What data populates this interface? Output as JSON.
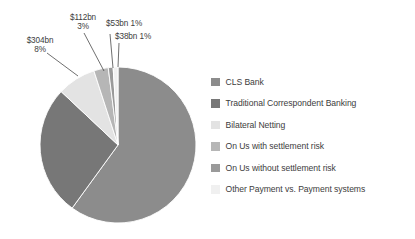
{
  "chart_data": {
    "type": "pie",
    "title": "",
    "subtitle": "",
    "xlabel": "",
    "ylabel": "",
    "grid": false,
    "legend_position": "right",
    "units": "USD billions (daily average)",
    "start_angle_deg": 0,
    "direction": "clockwise",
    "categories": [
      "CLS Bank",
      "Traditional Correspondent Banking",
      "Bilateral Netting",
      "On Us with settlement risk",
      "On Us without settlement risk",
      "Other Payment vs. Payment systems"
    ],
    "values": [
      2275,
      1025,
      304,
      112,
      53,
      38
    ],
    "percents": [
      60,
      27,
      8,
      3,
      1,
      1
    ],
    "colors": [
      "#8c8c8c",
      "#777777",
      "#e3e3e3",
      "#b6b6b6",
      "#9a9a9a",
      "#f0f0f0"
    ],
    "slices": [
      {
        "label": "CLS Bank",
        "value": 2275,
        "percent": 60,
        "color": "#8c8c8c",
        "start_deg": 0,
        "end_deg": 216,
        "data_label": ""
      },
      {
        "label": "Traditional Correspondent Banking",
        "value": 1025,
        "percent": 27,
        "color": "#777777",
        "start_deg": 216,
        "end_deg": 313.2,
        "data_label": ""
      },
      {
        "label": "Bilateral Netting",
        "value": 304,
        "percent": 8,
        "color": "#e3e3e3",
        "start_deg": 313.2,
        "end_deg": 342,
        "data_label": "$304bn 8%"
      },
      {
        "label": "On Us with settlement risk",
        "value": 112,
        "percent": 3,
        "color": "#b6b6b6",
        "start_deg": 342,
        "end_deg": 352.8,
        "data_label": "$112bn 3%"
      },
      {
        "label": "On Us without settlement risk",
        "value": 53,
        "percent": 1,
        "color": "#9a9a9a",
        "start_deg": 352.8,
        "end_deg": 356.4,
        "data_label": "$53bn 1%"
      },
      {
        "label": "Other Payment vs. Payment systems",
        "value": 38,
        "percent": 1,
        "color": "#f0f0f0",
        "start_deg": 356.4,
        "end_deg": 360,
        "data_label": "$38bn 1%"
      }
    ]
  },
  "callouts": [
    {
      "amount": "$304bn",
      "percent": "8%"
    },
    {
      "amount": "$112bn",
      "percent": "3%"
    },
    {
      "amount": "$53bn 1%",
      "percent": ""
    },
    {
      "amount": "$38bn 1%",
      "percent": ""
    }
  ],
  "legend": {
    "items": [
      {
        "label": "CLS Bank",
        "color": "#8c8c8c"
      },
      {
        "label": "Traditional Correspondent Banking",
        "color": "#777777"
      },
      {
        "label": "Bilateral Netting",
        "color": "#e3e3e3"
      },
      {
        "label": "On Us with settlement risk",
        "color": "#b6b6b6"
      },
      {
        "label": "On Us without settlement risk",
        "color": "#9a9a9a"
      },
      {
        "label": "Other Payment vs. Payment systems",
        "color": "#f0f0f0"
      }
    ]
  }
}
